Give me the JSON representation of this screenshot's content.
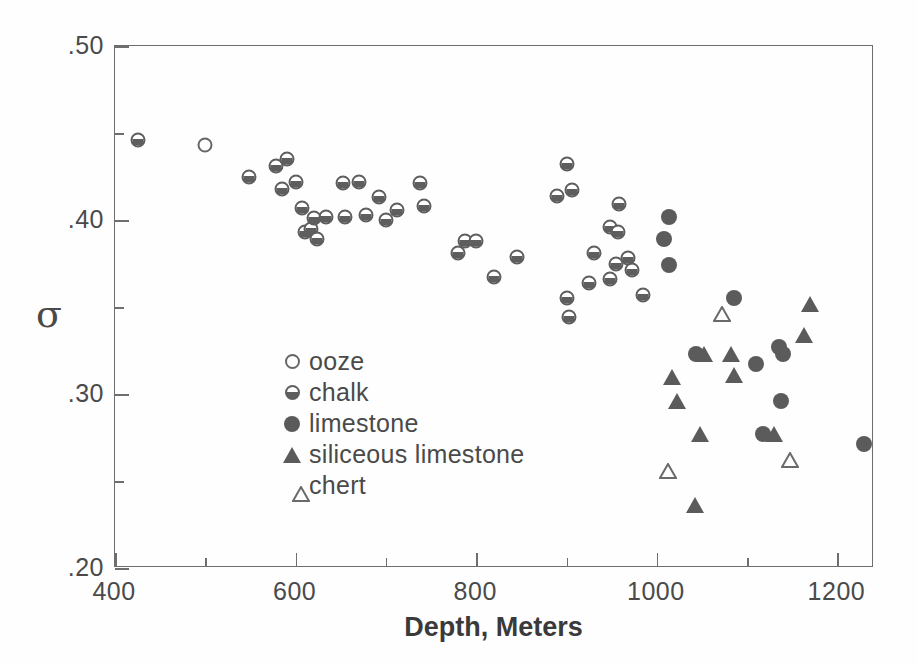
{
  "chart_data": {
    "type": "scatter",
    "title": "",
    "xlabel": "Depth, Meters",
    "ylabel": "σ",
    "xlim": [
      400,
      1260
    ],
    "ylim": [
      0.2,
      0.5
    ],
    "grid": false,
    "legend_position": "inner-left",
    "x_ticks_major": [
      400,
      600,
      800,
      1000,
      1200
    ],
    "x_ticks_minor": [
      500,
      700,
      900,
      1100
    ],
    "x_tick_labels": [
      "400",
      "600",
      "800",
      "1000",
      "1200"
    ],
    "y_ticks_major": [
      0.2,
      0.3,
      0.4,
      0.5
    ],
    "y_ticks_minor": [
      0.25,
      0.35,
      0.45
    ],
    "y_tick_labels": [
      ".20",
      ".30",
      ".40",
      ".50"
    ],
    "series": [
      {
        "name": "ooze",
        "marker": "open-circle",
        "color": "#666666",
        "points": [
          {
            "x": 500,
            "y": 0.443
          }
        ]
      },
      {
        "name": "chalk",
        "marker": "half-filled-circle",
        "color": "#5e5e5e",
        "points": [
          {
            "x": 425,
            "y": 0.446
          },
          {
            "x": 548,
            "y": 0.425
          },
          {
            "x": 578,
            "y": 0.431
          },
          {
            "x": 590,
            "y": 0.435
          },
          {
            "x": 585,
            "y": 0.418
          },
          {
            "x": 600,
            "y": 0.422
          },
          {
            "x": 607,
            "y": 0.407
          },
          {
            "x": 610,
            "y": 0.393
          },
          {
            "x": 617,
            "y": 0.395
          },
          {
            "x": 620,
            "y": 0.401
          },
          {
            "x": 624,
            "y": 0.389
          },
          {
            "x": 634,
            "y": 0.402
          },
          {
            "x": 652,
            "y": 0.421
          },
          {
            "x": 655,
            "y": 0.402
          },
          {
            "x": 670,
            "y": 0.422
          },
          {
            "x": 678,
            "y": 0.403
          },
          {
            "x": 692,
            "y": 0.413
          },
          {
            "x": 700,
            "y": 0.4
          },
          {
            "x": 712,
            "y": 0.406
          },
          {
            "x": 738,
            "y": 0.421
          },
          {
            "x": 742,
            "y": 0.408
          },
          {
            "x": 780,
            "y": 0.381
          },
          {
            "x": 788,
            "y": 0.388
          },
          {
            "x": 800,
            "y": 0.388
          },
          {
            "x": 820,
            "y": 0.367
          },
          {
            "x": 845,
            "y": 0.379
          },
          {
            "x": 890,
            "y": 0.414
          },
          {
            "x": 900,
            "y": 0.432
          },
          {
            "x": 906,
            "y": 0.417
          },
          {
            "x": 900,
            "y": 0.355
          },
          {
            "x": 903,
            "y": 0.344
          },
          {
            "x": 925,
            "y": 0.364
          },
          {
            "x": 930,
            "y": 0.381
          },
          {
            "x": 948,
            "y": 0.396
          },
          {
            "x": 958,
            "y": 0.409
          },
          {
            "x": 957,
            "y": 0.393
          },
          {
            "x": 955,
            "y": 0.375
          },
          {
            "x": 948,
            "y": 0.366
          },
          {
            "x": 968,
            "y": 0.378
          },
          {
            "x": 972,
            "y": 0.371
          },
          {
            "x": 985,
            "y": 0.357
          }
        ]
      },
      {
        "name": "limestone",
        "marker": "filled-circle",
        "color": "#5b5b5b",
        "points": [
          {
            "x": 1013,
            "y": 0.402
          },
          {
            "x": 1008,
            "y": 0.389
          },
          {
            "x": 1013,
            "y": 0.374
          },
          {
            "x": 1043,
            "y": 0.323
          },
          {
            "x": 1085,
            "y": 0.355
          },
          {
            "x": 1110,
            "y": 0.317
          },
          {
            "x": 1135,
            "y": 0.327
          },
          {
            "x": 1140,
            "y": 0.323
          },
          {
            "x": 1118,
            "y": 0.277
          },
          {
            "x": 1137,
            "y": 0.296
          },
          {
            "x": 1230,
            "y": 0.271
          }
        ]
      },
      {
        "name": "siliceous limestone",
        "marker": "filled-triangle",
        "color": "#5b5b5b",
        "points": [
          {
            "x": 1017,
            "y": 0.31
          },
          {
            "x": 1022,
            "y": 0.296
          },
          {
            "x": 1042,
            "y": 0.236
          },
          {
            "x": 1048,
            "y": 0.277
          },
          {
            "x": 1052,
            "y": 0.323
          },
          {
            "x": 1082,
            "y": 0.323
          },
          {
            "x": 1085,
            "y": 0.311
          },
          {
            "x": 1130,
            "y": 0.277
          },
          {
            "x": 1163,
            "y": 0.334
          },
          {
            "x": 1170,
            "y": 0.352
          }
        ]
      },
      {
        "name": "chert",
        "marker": "open-triangle",
        "color": "#6a6a6a",
        "points": [
          {
            "x": 1012,
            "y": 0.256
          },
          {
            "x": 1072,
            "y": 0.346
          },
          {
            "x": 1148,
            "y": 0.262
          }
        ]
      }
    ]
  },
  "legend": {
    "items": [
      {
        "label": "ooze",
        "marker": "open-circle"
      },
      {
        "label": "chalk",
        "marker": "half-filled-circle"
      },
      {
        "label": "limestone",
        "marker": "filled-circle"
      },
      {
        "label": "siliceous limestone",
        "marker": "filled-triangle"
      },
      {
        "label": "chert",
        "marker": "open-triangle"
      }
    ]
  }
}
